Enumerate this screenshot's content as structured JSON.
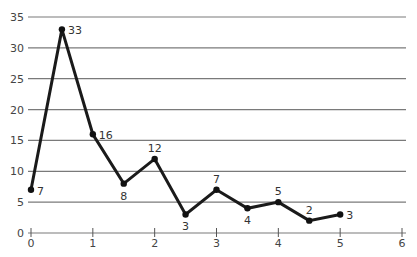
{
  "chart_data": {
    "type": "line",
    "title": "",
    "xlabel": "",
    "ylabel": "",
    "xlim": [
      0,
      6
    ],
    "ylim": [
      0,
      35
    ],
    "x_ticks": [
      0,
      1,
      2,
      3,
      4,
      5,
      6
    ],
    "y_ticks": [
      0,
      5,
      10,
      15,
      20,
      25,
      30,
      35
    ],
    "grid": "horizontal",
    "legend": null,
    "series": [
      {
        "name": "series-1",
        "color": "#1a1a1a",
        "x": [
          0,
          0.5,
          1,
          1.5,
          2,
          2.5,
          3,
          3.5,
          4,
          4.5,
          5
        ],
        "values": [
          7,
          33,
          16,
          8,
          12,
          3,
          7,
          4,
          5,
          2,
          3
        ],
        "labels": [
          "7",
          "33",
          "16",
          "8",
          "12",
          "3",
          "7",
          "4",
          "5",
          "2",
          "3"
        ],
        "label_positions": [
          "right",
          "right",
          "right",
          "below",
          "above",
          "below",
          "above",
          "below",
          "above",
          "above",
          "right"
        ]
      }
    ]
  }
}
